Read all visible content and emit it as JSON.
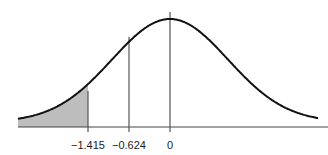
{
  "chart_data": {
    "type": "area",
    "title": "",
    "xlabel": "",
    "ylabel": "",
    "tick_labels": [
      "−1.415",
      "−0.624",
      "0"
    ],
    "tick_values": [
      -1.415,
      -0.624,
      0
    ],
    "shaded_region": {
      "from": "-inf",
      "to": -1.415
    },
    "vertical_lines": [
      -1.415,
      -0.624,
      0
    ],
    "grid": false,
    "colors": {
      "curve": "#111111",
      "shade": "#bdbdbd",
      "lines": "#555555"
    }
  },
  "labels": {
    "t1": "−1.415",
    "t2": "−0.624",
    "t3": "0"
  }
}
